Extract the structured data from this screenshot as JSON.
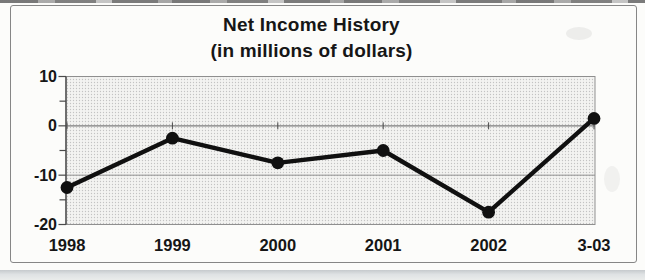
{
  "chart_data": {
    "type": "line",
    "title": "Net Income History",
    "subtitle": "(in millions of dollars)",
    "categories": [
      "1998",
      "1999",
      "2000",
      "2001",
      "2002",
      "3-03"
    ],
    "values": [
      -12.5,
      -2.5,
      -7.5,
      -5,
      -17.5,
      1.5
    ],
    "ylim": [
      -20,
      10
    ],
    "yticks": [
      10,
      0,
      -10,
      -20
    ],
    "ytick_labels": [
      "10",
      "0",
      "-10",
      "-20"
    ],
    "minor_tick_step": 5,
    "xlabel": "",
    "ylabel": "",
    "legend": "none",
    "grid": "horizontal major gridlines",
    "marker_style": "filled circle",
    "plot_fill": "halftone light gray",
    "colors": {
      "line": "#101010",
      "marker": "#101010",
      "gridline": "#8f8f8f",
      "zero_axis": "#7c7c7c",
      "axis": "#4a4a4a",
      "plot_fill_base": "#f3f3f1",
      "plot_fill_dot": "#c3c3c3",
      "frame_border": "#868686",
      "text": "#161616",
      "bottom_band": "#d6d9db"
    }
  }
}
